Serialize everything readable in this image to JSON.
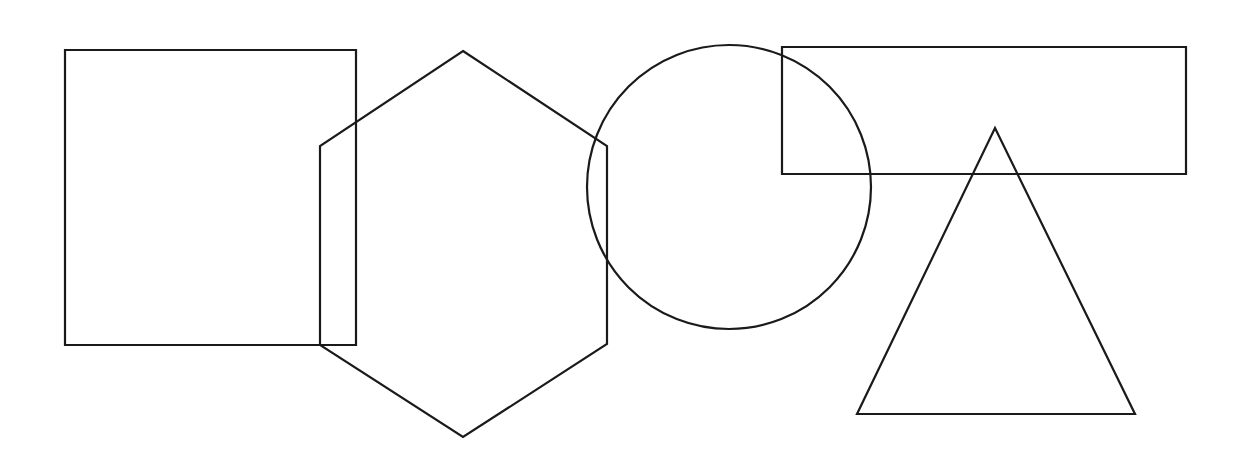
{
  "canvas": {
    "width": 1249,
    "height": 471,
    "background_color": "#ffffff",
    "stroke_color": "#1a1a1a",
    "stroke_width": 2.2,
    "fill": "none",
    "description": "Line drawing of five overlapping outlined geometric shapes on a plain white background"
  },
  "shapes": [
    {
      "id": "square",
      "name": "square",
      "kind": "rectangle",
      "label": "Square",
      "x": 65,
      "y": 50,
      "width": 291,
      "height": 295,
      "points": "65,50 356,50 356,345 65,345",
      "stroke_color": "#1a1a1a",
      "fill": "none"
    },
    {
      "id": "hexagon",
      "name": "hexagon",
      "kind": "polygon",
      "label": "Hexagon",
      "sides": 6,
      "orientation": "pointy-top",
      "center_x": 463,
      "center_y": 244,
      "points": "463,51 607,146 607,344 463,437 320,345 320,146",
      "stroke_color": "#1a1a1a",
      "fill": "none"
    },
    {
      "id": "circle",
      "name": "circle",
      "kind": "circle",
      "label": "Circle",
      "center_x": 729,
      "center_y": 187,
      "radius": 142,
      "stroke_color": "#1a1a1a",
      "fill": "none"
    },
    {
      "id": "rectangle",
      "name": "rectangle",
      "kind": "rectangle",
      "label": "Rectangle",
      "x": 782,
      "y": 47,
      "width": 404,
      "height": 127,
      "points": "782,47 1186,47 1186,174 782,174",
      "stroke_color": "#1a1a1a",
      "fill": "none"
    },
    {
      "id": "triangle",
      "name": "triangle",
      "kind": "polygon",
      "label": "Triangle",
      "sides": 3,
      "orientation": "apex-up",
      "points": "995,128 1135,414 857,414",
      "stroke_color": "#1a1a1a",
      "fill": "none"
    }
  ]
}
